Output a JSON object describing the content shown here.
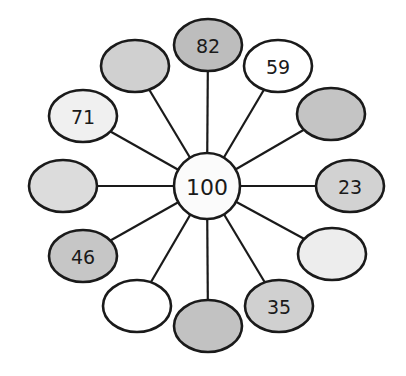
{
  "diagram": {
    "title": "",
    "center": {
      "label": "100",
      "x": 207,
      "y": 186,
      "r": 33,
      "fill": "#fbfbfb"
    },
    "nodes": [
      {
        "id": "n-top",
        "label": "82",
        "x": 208,
        "y": 45,
        "fill": "#bdbdbd"
      },
      {
        "id": "n-top-right",
        "label": "59",
        "x": 278,
        "y": 66,
        "fill": "#ffffff"
      },
      {
        "id": "n-right-top",
        "label": "",
        "x": 331,
        "y": 114,
        "fill": "#c4c4c4"
      },
      {
        "id": "n-right",
        "label": "23",
        "x": 350,
        "y": 186,
        "fill": "#d2d2d2"
      },
      {
        "id": "n-right-bottom",
        "label": "",
        "x": 332,
        "y": 254,
        "fill": "#ededed"
      },
      {
        "id": "n-bottom-right",
        "label": "35",
        "x": 279,
        "y": 306,
        "fill": "#d0d0d0"
      },
      {
        "id": "n-bottom",
        "label": "",
        "x": 208,
        "y": 326,
        "fill": "#c2c2c2"
      },
      {
        "id": "n-bottom-left",
        "label": "",
        "x": 137,
        "y": 306,
        "fill": "#ffffff"
      },
      {
        "id": "n-left-bottom",
        "label": "46",
        "x": 83,
        "y": 256,
        "fill": "#c6c6c6"
      },
      {
        "id": "n-left",
        "label": "",
        "x": 63,
        "y": 186,
        "fill": "#dcdcdc"
      },
      {
        "id": "n-left-top",
        "label": "71",
        "x": 83,
        "y": 116,
        "fill": "#f0f0f0"
      },
      {
        "id": "n-top-left",
        "label": "",
        "x": 135,
        "y": 66,
        "fill": "#d0d0d0"
      }
    ],
    "node_rx": 34,
    "node_ry": 26,
    "stroke_color": "#1a1a1a"
  }
}
